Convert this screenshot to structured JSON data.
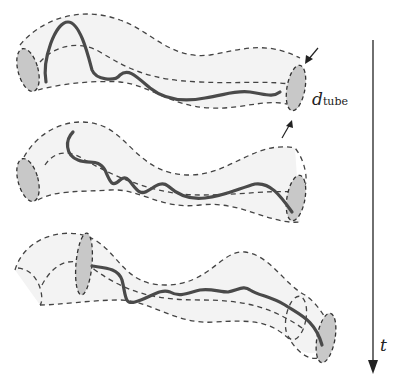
{
  "figure": {
    "type": "reptation tube diagram",
    "panels": [
      "tube-top",
      "tube-middle",
      "tube-bottom"
    ],
    "labels": {
      "diameter_main": "d",
      "diameter_sub": "tube",
      "time_axis": "t"
    },
    "colors": {
      "tube_fill": "#f3f3f3",
      "tube_outline": "#444444",
      "cap_fill": "#c8c8c8",
      "chain": "#4a4a4a"
    }
  }
}
